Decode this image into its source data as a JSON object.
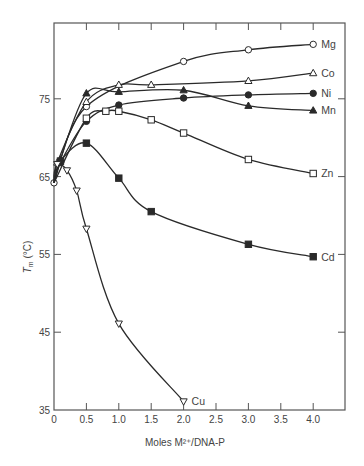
{
  "chart_data": {
    "type": "line",
    "title": "",
    "xlabel": "Moles M²⁺/DNA-P",
    "ylabel": "Tm (°C)",
    "ylabel_main": "T",
    "ylabel_sub": "m",
    "ylabel_rest": " (°C)",
    "xlim": [
      0,
      4.5
    ],
    "ylim": [
      35,
      82
    ],
    "grid": false,
    "legend_position": "inline-right",
    "x_ticks": [
      0,
      0.5,
      1.0,
      1.5,
      2.0,
      2.5,
      3.0,
      3.5,
      4.0
    ],
    "x_tick_labels": [
      "0",
      "0.5",
      "1.0",
      "1.5",
      "2.0",
      "2.5",
      "3.0",
      "3.5",
      "4.0"
    ],
    "y_ticks": [
      35,
      45,
      55,
      65,
      75
    ],
    "y_tick_labels": [
      "35",
      "45",
      "55",
      "65",
      "75"
    ],
    "series": [
      {
        "name": "Mg",
        "marker": "open-circle",
        "x": [
          0,
          0.5,
          2.0,
          3.0,
          4.0
        ],
        "y": [
          64.2,
          74.0,
          79.8,
          81.3,
          82.0
        ]
      },
      {
        "name": "Co",
        "marker": "open-triangle-up",
        "x": [
          0,
          0.05,
          0.5,
          1.0,
          1.5,
          3.0,
          4.0
        ],
        "y": [
          64.2,
          66.8,
          74.6,
          76.8,
          76.8,
          77.3,
          78.3
        ]
      },
      {
        "name": "Ni",
        "marker": "filled-circle",
        "x": [
          0,
          0.1,
          0.5,
          1.0,
          2.0,
          3.0,
          4.0
        ],
        "y": [
          64.2,
          66.8,
          72.1,
          74.2,
          75.1,
          75.5,
          75.7
        ]
      },
      {
        "name": "Mn",
        "marker": "filled-triangle-up",
        "x": [
          0,
          0.1,
          0.5,
          1.0,
          2.0,
          3.0,
          4.0
        ],
        "y": [
          64.2,
          67.2,
          75.7,
          75.9,
          76.1,
          74.1,
          73.5
        ]
      },
      {
        "name": "Zn",
        "marker": "open-square",
        "x": [
          0,
          0.5,
          0.8,
          1.0,
          1.5,
          2.0,
          3.0,
          4.0
        ],
        "y": [
          64.2,
          72.5,
          73.4,
          73.4,
          72.3,
          70.6,
          67.2,
          65.4
        ]
      },
      {
        "name": "Cd",
        "marker": "filled-square",
        "x": [
          0,
          0.1,
          0.5,
          1.0,
          1.5,
          3.0,
          4.0
        ],
        "y": [
          64.2,
          67.0,
          69.3,
          64.8,
          60.5,
          56.3,
          54.7
        ]
      },
      {
        "name": "Cu",
        "marker": "open-triangle-down",
        "x": [
          0,
          0.05,
          0.2,
          0.35,
          0.5,
          1.0,
          2.0
        ],
        "y": [
          64.2,
          66.6,
          65.8,
          63.2,
          58.3,
          46.1,
          36.1
        ]
      }
    ]
  },
  "layout": {
    "frame": {
      "left": 54,
      "top": 23,
      "right": 345,
      "bottom": 410
    },
    "x_per_unit": 64.8,
    "y_zero_px": 410,
    "y_zero_val": 35,
    "y_per_unit": 7.78
  }
}
